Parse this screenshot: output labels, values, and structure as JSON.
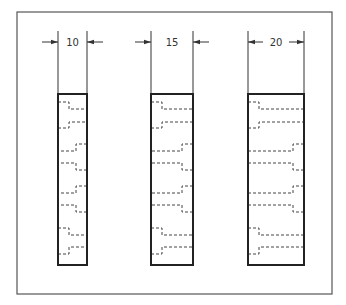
{
  "diagram": {
    "type": "engineering-drawing",
    "colors": {
      "frame": "#555555",
      "outline": "#222222",
      "hidden": "#444444",
      "dimension": "#333333",
      "background": "#ffffff"
    },
    "frame": {
      "x": 17,
      "y": 12,
      "width": 315,
      "height": 282
    },
    "blocks": [
      {
        "id": "block-1",
        "dimension_label": "10",
        "x": 58,
        "y": 94,
        "width": 29,
        "height": 171,
        "text_gap": true
      },
      {
        "id": "block-2",
        "dimension_label": "15",
        "x": 151,
        "y": 94,
        "width": 42,
        "height": 171,
        "text_gap": true
      },
      {
        "id": "block-3",
        "dimension_label": "20",
        "x": 248,
        "y": 94,
        "width": 56,
        "height": 171,
        "text_gap": false
      }
    ],
    "holes_pattern": [
      {
        "row": 1,
        "counterbore_side": "left",
        "cb_top": 8,
        "cb_bottom": 34,
        "shaft_top": 15,
        "shaft_bottom": 28
      },
      {
        "row": 2,
        "counterbore_side": "right",
        "cb_top": 50,
        "cb_bottom": 76,
        "shaft_top": 57,
        "shaft_bottom": 69
      },
      {
        "row": 3,
        "counterbore_side": "right",
        "cb_top": 92,
        "cb_bottom": 118,
        "shaft_top": 99,
        "shaft_bottom": 111
      },
      {
        "row": 4,
        "counterbore_side": "left",
        "cb_top": 134,
        "cb_bottom": 160,
        "shaft_top": 141,
        "shaft_bottom": 153
      }
    ],
    "counterbore_depth": 11
  }
}
